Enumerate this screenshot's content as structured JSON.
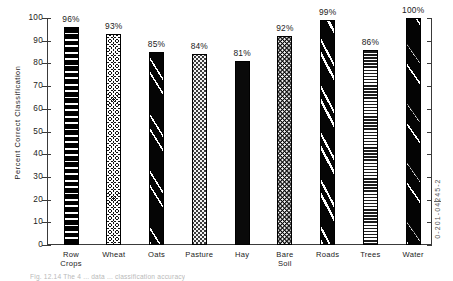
{
  "figure": {
    "ylabel": "Percent  Correct  Classification",
    "isbn": "0-201-04245-2",
    "caption": "Fig. 12.14   The 4 ... data ... classification accuracy"
  },
  "chart_data": {
    "type": "bar",
    "title": "",
    "xlabel": "",
    "ylabel": "Percent Correct Classification",
    "ylim": [
      0,
      100
    ],
    "ytick_labels": [
      "100",
      "90",
      "80",
      "70",
      "60",
      "50",
      "40",
      "30",
      "20",
      "10",
      "0"
    ],
    "ytick_values": [
      100,
      90,
      80,
      70,
      60,
      50,
      40,
      30,
      20,
      10,
      0
    ],
    "grid": false,
    "legend": "none",
    "categories": [
      "Row\nCrops",
      "Wheat",
      "Oats",
      "Pasture",
      "Hay",
      "Bare\nSoil",
      "Roads",
      "Trees",
      "Water"
    ],
    "values": [
      96,
      93,
      85,
      84,
      81,
      92,
      99,
      86,
      100
    ],
    "value_labels": [
      "96%",
      "93%",
      "85%",
      "84%",
      "81%",
      "92%",
      "99%",
      "86%",
      "100%"
    ],
    "bar_patterns": [
      "thick-horizontal-stripes",
      "fine-crosshatch",
      "black-with-white-diagonals",
      "light-stipple-dots",
      "solid-black",
      "black-with-white-dots",
      "black-with-bold-white-diagonals",
      "fine-horizontal-stripes",
      "black-with-sparse-white-diagonals"
    ]
  },
  "bars": [
    {
      "label_line1": "Row",
      "label_line2": "Crops",
      "value_label": "96%",
      "value": 96
    },
    {
      "label_line1": "Wheat",
      "label_line2": "",
      "value_label": "93%",
      "value": 93
    },
    {
      "label_line1": "Oats",
      "label_line2": "",
      "value_label": "85%",
      "value": 85
    },
    {
      "label_line1": "Pasture",
      "label_line2": "",
      "value_label": "84%",
      "value": 84
    },
    {
      "label_line1": "Hay",
      "label_line2": "",
      "value_label": "81%",
      "value": 81
    },
    {
      "label_line1": "Bare",
      "label_line2": "Soil",
      "value_label": "92%",
      "value": 92
    },
    {
      "label_line1": "Roads",
      "label_line2": "",
      "value_label": "99%",
      "value": 99
    },
    {
      "label_line1": "Trees",
      "label_line2": "",
      "value_label": "86%",
      "value": 86
    },
    {
      "label_line1": "Water",
      "label_line2": "",
      "value_label": "100%",
      "value": 100
    }
  ]
}
